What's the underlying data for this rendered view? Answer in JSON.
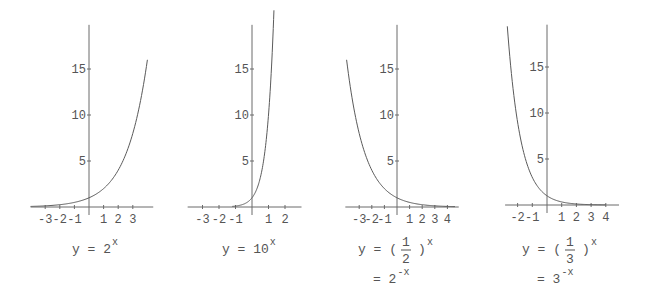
{
  "figure": {
    "colors": {
      "axis": "#6a6a6a",
      "curve": "#5a5a5a",
      "text": "#555555",
      "background": "#ffffff"
    }
  },
  "chart_data": [
    {
      "type": "line",
      "title": "",
      "caption": {
        "lhs": "y = ",
        "base": "2",
        "exponent": "x"
      },
      "function": "2^x",
      "base": 2,
      "xlabel": "",
      "ylabel": "",
      "xlim": [
        -4,
        4
      ],
      "ylim": [
        0,
        20
      ],
      "x_ticks": [
        -3,
        -2,
        -1,
        1,
        2,
        3
      ],
      "x_tick_labels": [
        "-3",
        "-2",
        "-1",
        "1",
        "2",
        "3"
      ],
      "y_ticks": [
        5,
        10,
        15
      ],
      "y_tick_labels": [
        "5",
        "10",
        "15"
      ],
      "grid": false,
      "x": [
        -4,
        -3,
        -2,
        -1,
        0,
        1,
        2,
        3,
        4
      ],
      "values": [
        0.0625,
        0.125,
        0.25,
        0.5,
        1,
        2,
        4,
        8,
        16
      ],
      "layout": {
        "origin_x": 89,
        "origin_y": 207,
        "px_per_x": 14.6,
        "px_per_y": 9.2,
        "x_axis_from": -4.0,
        "x_axis_to": 4.4,
        "y_axis_top": 19.8,
        "curve_x_from": -4.0,
        "curve_x_to": 4.0,
        "caption_x": 72,
        "caption_y": 253
      }
    },
    {
      "type": "line",
      "title": "",
      "caption": {
        "lhs": "y = ",
        "base": "10",
        "exponent": "x"
      },
      "function": "10^x",
      "base": 10,
      "xlabel": "",
      "ylabel": "",
      "xlim": [
        -4,
        3
      ],
      "ylim": [
        0,
        20
      ],
      "x_ticks": [
        -3,
        -2,
        -1,
        1,
        2
      ],
      "x_tick_labels": [
        "-3",
        "-2",
        "-1",
        "1",
        "2"
      ],
      "y_ticks": [
        5,
        10,
        15
      ],
      "y_tick_labels": [
        "5",
        "10",
        "15"
      ],
      "grid": false,
      "x": [
        -3,
        -2,
        -1,
        0,
        0.5,
        1,
        1.3
      ],
      "values": [
        0.001,
        0.01,
        0.1,
        1,
        3.16,
        10,
        19.95
      ],
      "layout": {
        "origin_x": 252,
        "origin_y": 207,
        "px_per_x": 16.5,
        "px_per_y": 9.2,
        "x_axis_from": -3.9,
        "x_axis_to": 3.0,
        "y_axis_top": 19.8,
        "curve_x_from": -1.2,
        "curve_x_to": 1.33,
        "caption_x": 222,
        "caption_y": 253
      }
    },
    {
      "type": "line",
      "title": "",
      "caption": {
        "lhs": "y = ",
        "fraction_num": "1",
        "fraction_den": "2",
        "exponent": "x",
        "line2_lhs": "= ",
        "line2_base": "2",
        "line2_exponent": "-x"
      },
      "function": "(1/2)^x = 2^-x",
      "base": 0.5,
      "xlabel": "",
      "ylabel": "",
      "xlim": [
        -4,
        5
      ],
      "ylim": [
        0,
        20
      ],
      "x_ticks": [
        -3,
        -2,
        -1,
        1,
        2,
        3,
        4
      ],
      "x_tick_labels": [
        "-3",
        "-2",
        "-1",
        "1",
        "2",
        "3",
        "4"
      ],
      "y_ticks": [
        5,
        10,
        15
      ],
      "y_tick_labels": [
        "5",
        "10",
        "15"
      ],
      "grid": false,
      "x": [
        -4,
        -3,
        -2,
        -1,
        0,
        1,
        2,
        3,
        4
      ],
      "values": [
        16,
        8,
        4,
        2,
        1,
        0.5,
        0.25,
        0.125,
        0.0625
      ],
      "layout": {
        "origin_x": 397,
        "origin_y": 207,
        "px_per_x": 12.6,
        "px_per_y": 9.2,
        "x_axis_from": -4.1,
        "x_axis_to": 4.9,
        "y_axis_top": 19.8,
        "curve_x_from": -4.0,
        "curve_x_to": 4.6,
        "caption_x": 358,
        "caption_y": 253
      }
    },
    {
      "type": "line",
      "title": "",
      "caption": {
        "lhs": "y = ",
        "fraction_num": "1",
        "fraction_den": "3",
        "exponent": "x",
        "line2_lhs": "= ",
        "line2_base": "3",
        "line2_exponent": "-x"
      },
      "function": "(1/3)^x = 3^-x",
      "base": 0.3333,
      "xlabel": "",
      "ylabel": "",
      "xlim": [
        -3,
        5
      ],
      "ylim": [
        0,
        20
      ],
      "x_ticks": [
        -2,
        -1,
        1,
        2,
        3,
        4
      ],
      "x_tick_labels": [
        "-2",
        "-1",
        "1",
        "2",
        "3",
        "4"
      ],
      "y_ticks": [
        5,
        10,
        15
      ],
      "y_tick_labels": [
        "5",
        "10",
        "15"
      ],
      "grid": false,
      "x": [
        -2.7,
        -2,
        -1,
        0,
        1,
        2,
        3,
        4
      ],
      "values": [
        19.4,
        9,
        3,
        1,
        0.333,
        0.111,
        0.037,
        0.012
      ],
      "layout": {
        "origin_x": 547,
        "origin_y": 205,
        "px_per_x": 14.7,
        "px_per_y": 9.2,
        "x_axis_from": -2.85,
        "x_axis_to": 4.9,
        "y_axis_top": 19.6,
        "curve_x_from": -2.7,
        "curve_x_to": 4.0,
        "caption_x": 522,
        "caption_y": 253
      }
    }
  ]
}
